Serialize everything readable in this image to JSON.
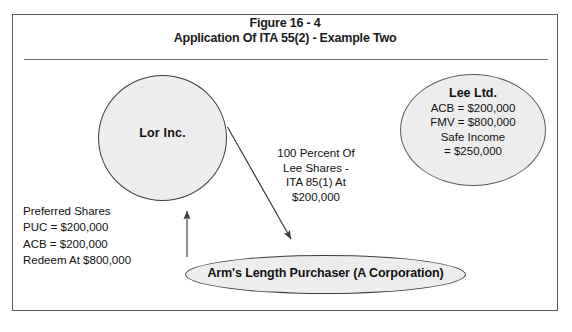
{
  "figure": {
    "title_line1": "Figure 16 - 4",
    "title_line2": "Application Of ITA 55(2) - Example Two"
  },
  "nodes": {
    "lor": {
      "name": "Lor Inc.",
      "shape": "circle"
    },
    "lee": {
      "name": "Lee Ltd.",
      "acb": "ACB  =  $200,000",
      "fmv": "FMV  =  $800,000",
      "safe_income_label": "Safe Income",
      "safe_income_value": "=  $250,000",
      "shape": "circle"
    },
    "purchaser": {
      "name": "Arm's Length Purchaser (A Corporation)",
      "shape": "ellipse"
    }
  },
  "annotations": {
    "transfer": {
      "line1": "100 Percent Of",
      "line2": "Lee Shares -",
      "line3": "ITA 85(1) At",
      "line4": "$200,000"
    },
    "preferred_shares": {
      "line1": "Preferred Shares",
      "line2": "PUC  =  $200,000",
      "line3": "ACB  =  $200,000",
      "line4": "Redeem At $800,000"
    }
  },
  "colors": {
    "shape_fill": "#ededed",
    "shape_stroke": "#3d3d3d",
    "frame_stroke": "#5a5a5a",
    "text": "#111111",
    "arrow": "#3a3a3a"
  }
}
